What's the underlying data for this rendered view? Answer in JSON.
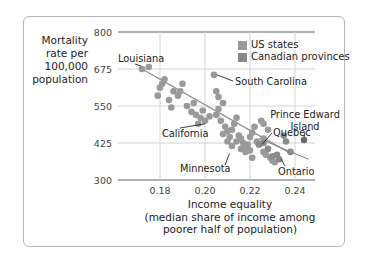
{
  "chart_data": {
    "type": "scatter",
    "title": "",
    "xlabel": "Income equality (median share of income among poorer half of population)",
    "xlabel_lines": [
      "Income equality",
      "(median share of income among",
      "poorer half of population)"
    ],
    "ylabel": "Mortality rate per 100,000 population",
    "ylabel_lines": [
      "Mortality",
      "rate per",
      "100,000",
      "population"
    ],
    "xlim": [
      0.165,
      0.25
    ],
    "ylim": [
      300,
      800
    ],
    "x_ticks": [
      "0.18",
      "0.20",
      "0.22",
      "0.24"
    ],
    "y_ticks": [
      "800",
      "675",
      "550",
      "425",
      "300"
    ],
    "grid": true,
    "legend_position": "upper right",
    "legend": [
      "US states",
      "Canadian provinces"
    ],
    "colors": {
      "us_states": "#9a9a9a",
      "canadian_provinces": "#8a8a8a",
      "grid": "#cfcfcf",
      "axis": "#b0b0b0",
      "trend": "#8c8c8c"
    },
    "series": [
      {
        "name": "US states",
        "points": [
          [
            0.172,
            675
          ],
          [
            0.175,
            682
          ],
          [
            0.18,
            612
          ],
          [
            0.181,
            625
          ],
          [
            0.182,
            640
          ],
          [
            0.179,
            585
          ],
          [
            0.184,
            570
          ],
          [
            0.186,
            600
          ],
          [
            0.188,
            585
          ],
          [
            0.19,
            625
          ],
          [
            0.189,
            600
          ],
          [
            0.185,
            545
          ],
          [
            0.192,
            550
          ],
          [
            0.195,
            560
          ],
          [
            0.194,
            530
          ],
          [
            0.196,
            520
          ],
          [
            0.198,
            510
          ],
          [
            0.199,
            535
          ],
          [
            0.2,
            500
          ],
          [
            0.197,
            490
          ],
          [
            0.202,
            515
          ],
          [
            0.204,
            655
          ],
          [
            0.205,
            600
          ],
          [
            0.206,
            580
          ],
          [
            0.208,
            560
          ],
          [
            0.206,
            540
          ],
          [
            0.205,
            520
          ],
          [
            0.207,
            500
          ],
          [
            0.209,
            480
          ],
          [
            0.21,
            465
          ],
          [
            0.208,
            455
          ],
          [
            0.211,
            445
          ],
          [
            0.212,
            470
          ],
          [
            0.213,
            490
          ],
          [
            0.214,
            510
          ],
          [
            0.215,
            450
          ],
          [
            0.216,
            440
          ],
          [
            0.214,
            430
          ],
          [
            0.217,
            425
          ],
          [
            0.218,
            410
          ],
          [
            0.219,
            420
          ],
          [
            0.22,
            445
          ],
          [
            0.221,
            460
          ],
          [
            0.222,
            480
          ],
          [
            0.22,
            400
          ],
          [
            0.218,
            395
          ],
          [
            0.216,
            405
          ],
          [
            0.212,
            415
          ],
          [
            0.21,
            430
          ],
          [
            0.223,
            430
          ],
          [
            0.224,
            420
          ],
          [
            0.225,
            500
          ],
          [
            0.226,
            490
          ],
          [
            0.228,
            470
          ],
          [
            0.226,
            395
          ],
          [
            0.227,
            385
          ],
          [
            0.229,
            375
          ],
          [
            0.23,
            365
          ],
          [
            0.231,
            360
          ],
          [
            0.221,
            375
          ],
          [
            0.226,
            440
          ]
        ]
      },
      {
        "name": "Canadian provinces",
        "points": [
          [
            0.224,
            420
          ],
          [
            0.233,
            370
          ],
          [
            0.235,
            450
          ],
          [
            0.236,
            430
          ],
          [
            0.238,
            395
          ],
          [
            0.244,
            435
          ],
          [
            0.232,
            385
          ],
          [
            0.23,
            380
          ],
          [
            0.228,
            405
          ],
          [
            0.226,
            425
          ]
        ]
      }
    ],
    "trend_lines": [
      {
        "name": "US trend",
        "from": [
          0.172,
          675
        ],
        "to": [
          0.238,
          390
        ]
      },
      {
        "name": "Canada trend",
        "from": [
          0.224,
          440
        ],
        "to": [
          0.246,
          370
        ]
      }
    ],
    "annotations": [
      {
        "label": "Louisiana",
        "point": [
          0.172,
          675
        ]
      },
      {
        "label": "South Carolina",
        "point": [
          0.204,
          655
        ]
      },
      {
        "label": "California",
        "point": [
          0.2,
          500
        ]
      },
      {
        "label": "Prince Edward Island",
        "label_lines": [
          "Prince Edward",
          "Island"
        ],
        "point": [
          0.244,
          435
        ]
      },
      {
        "label": "Quebec",
        "point": [
          0.224,
          420
        ]
      },
      {
        "label": "Minnesota",
        "point": [
          0.21,
          390
        ]
      },
      {
        "label": "Ontario",
        "point": [
          0.233,
          370
        ]
      }
    ]
  },
  "labels": {
    "ylabel": [
      "Mortality",
      "rate per",
      "100,000",
      "population"
    ],
    "xlabel": [
      "Income equality",
      "(median share of income among",
      "poorer half of population)"
    ],
    "legend": [
      "US states",
      "Canadian provinces"
    ]
  }
}
